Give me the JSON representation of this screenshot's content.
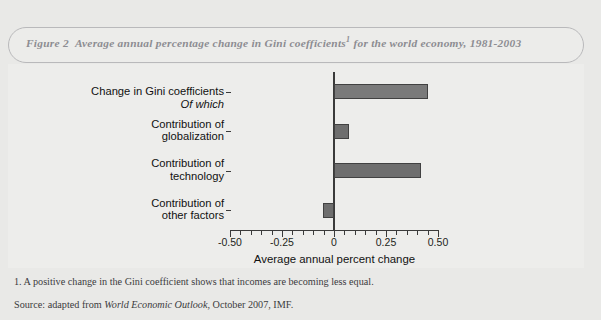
{
  "figure": {
    "label": "Figure 2",
    "title": "Average annual percentage change in Gini coefficients",
    "title_footnote_marker": "1",
    "title_tail": "for the world economy, 1981-2003",
    "footnote": "1. A positive change in the Gini coefficient shows that incomes are becoming less equal.",
    "source_prefix": "Source: adapted from ",
    "source_italic": "World Economic Outlook",
    "source_suffix": ", October 2007, IMF.",
    "subheading": "Of which"
  },
  "colors": {
    "page_background": "#e9e9e7",
    "panel_background": "#ededeb",
    "title_box_border": "#b9b9bb",
    "title_text": "#8d8d92",
    "bar_fill": "#6e6e6e",
    "bar_fill_light": "#7a7a7a",
    "bar_stroke": "#414141",
    "axis": "#3a3a3a"
  },
  "chart_data": {
    "type": "bar",
    "orientation": "horizontal",
    "categories": [
      "Change in Gini coefficients",
      "Contribution of globalization",
      "Contribution of technology",
      "Contribution of other factors"
    ],
    "values": [
      0.45,
      0.07,
      0.42,
      -0.055
    ],
    "xlabel": "Average annual percent change",
    "ylabel": "",
    "xlim": [
      -0.5,
      0.5
    ],
    "xticks": [
      -0.5,
      -0.25,
      0,
      0.25,
      0.5
    ],
    "xtick_labels": [
      "-0.50",
      "-0.25",
      "0",
      "0.25",
      "0.50"
    ],
    "minor_tick_step": 0.05,
    "grid": false,
    "legend": false
  },
  "category_labels": [
    {
      "line1": "Change in Gini coefficients",
      "line2": ""
    },
    {
      "line1": "Contribution of",
      "line2": "globalization"
    },
    {
      "line1": "Contribution of",
      "line2": "technology"
    },
    {
      "line1": "Contribution of",
      "line2": "other factors"
    }
  ]
}
